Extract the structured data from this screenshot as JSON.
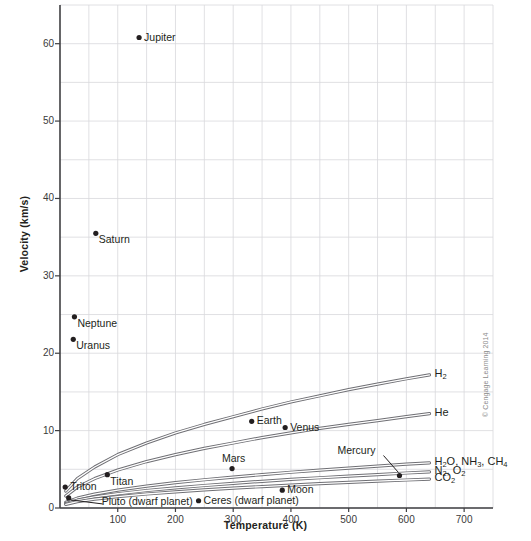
{
  "figure": {
    "credit": "© Cengage Learning 2014"
  },
  "chart_data": {
    "type": "line",
    "title": "",
    "xlabel": "Temperature (K)",
    "ylabel": "Velocity (km/s)",
    "xlim": [
      0,
      750
    ],
    "ylim": [
      0,
      65
    ],
    "grid": true,
    "x_major_ticks": [
      100,
      200,
      300,
      400,
      500,
      600,
      700
    ],
    "x_tick_labels": [
      "100",
      "200",
      "300",
      "400",
      "500",
      "600",
      "700"
    ],
    "x_minor_step": 50,
    "y_major_ticks": [
      0,
      10,
      20,
      30,
      40,
      50,
      60
    ],
    "y_tick_labels": [
      "0",
      "10",
      "20",
      "30",
      "40",
      "50",
      "60"
    ],
    "y_minor_step": 5,
    "legend_position": "inline-right-of-curve-ends",
    "series": [
      {
        "name": "H2",
        "label": "H<sub>2</sub>",
        "label_plain": "H2",
        "x": [
          10,
          30,
          60,
          100,
          150,
          200,
          250,
          300,
          350,
          400,
          450,
          500,
          550,
          600,
          640
        ],
        "y": [
          2.2,
          3.8,
          5.3,
          6.9,
          8.4,
          9.7,
          10.8,
          11.8,
          12.8,
          13.7,
          14.5,
          15.3,
          16.0,
          16.7,
          17.2
        ]
      },
      {
        "name": "He",
        "label": "He",
        "label_plain": "He",
        "x": [
          10,
          30,
          60,
          100,
          150,
          200,
          250,
          300,
          350,
          400,
          450,
          500,
          550,
          600,
          640
        ],
        "y": [
          1.55,
          2.7,
          3.8,
          4.9,
          6.0,
          6.9,
          7.7,
          8.4,
          9.1,
          9.7,
          10.3,
          10.8,
          11.3,
          11.8,
          12.2
        ]
      },
      {
        "name": "H2O, NH3, CH4",
        "label": "H<sub>2</sub>O, NH<sub>3</sub>, CH<sub>4</sub>",
        "label_plain": "H2O, NH3, CH4",
        "x": [
          10,
          30,
          60,
          100,
          150,
          200,
          250,
          300,
          350,
          400,
          450,
          500,
          550,
          600,
          640
        ],
        "y": [
          0.73,
          1.27,
          1.79,
          2.31,
          2.83,
          3.27,
          3.65,
          4.0,
          4.32,
          4.62,
          4.9,
          5.16,
          5.42,
          5.66,
          5.84
        ]
      },
      {
        "name": "N2, O2",
        "label": "N<sub>2</sub>, O<sub>2</sub>",
        "label_plain": "N2, O2",
        "x": [
          10,
          30,
          60,
          100,
          150,
          200,
          250,
          300,
          350,
          400,
          450,
          500,
          550,
          600,
          640
        ],
        "y": [
          0.58,
          1.01,
          1.43,
          1.84,
          2.26,
          2.61,
          2.91,
          3.19,
          3.45,
          3.69,
          3.91,
          4.12,
          4.32,
          4.52,
          4.66
        ]
      },
      {
        "name": "CO2",
        "label": "CO<sub>2</sub>",
        "label_plain": "CO2",
        "x": [
          10,
          30,
          60,
          100,
          150,
          200,
          250,
          300,
          350,
          400,
          450,
          500,
          550,
          600,
          640
        ],
        "y": [
          0.47,
          0.81,
          1.14,
          1.48,
          1.81,
          2.09,
          2.34,
          2.56,
          2.77,
          2.96,
          3.14,
          3.31,
          3.47,
          3.62,
          3.74
        ]
      }
    ],
    "points": [
      {
        "name": "Jupiter",
        "x": 137,
        "y": 60.8,
        "label": "Jupiter",
        "label_pos": "right"
      },
      {
        "name": "Saturn",
        "x": 62,
        "y": 35.5,
        "label": "Saturn",
        "label_pos": "below-right"
      },
      {
        "name": "Neptune",
        "x": 25,
        "y": 24.7,
        "label": "Neptune",
        "label_pos": "below-right"
      },
      {
        "name": "Uranus",
        "x": 23,
        "y": 21.8,
        "label": "Uranus",
        "label_pos": "below-right"
      },
      {
        "name": "Earth",
        "x": 332,
        "y": 11.2,
        "label": "Earth",
        "label_pos": "right"
      },
      {
        "name": "Venus",
        "x": 390,
        "y": 10.4,
        "label": "Venus",
        "label_pos": "right"
      },
      {
        "name": "Mars",
        "x": 298,
        "y": 5.1,
        "label": "Mars",
        "label_pos": "above"
      },
      {
        "name": "Mercury",
        "x": 588,
        "y": 4.2,
        "label": "Mercury",
        "label_pos": "leader-upper-left"
      },
      {
        "name": "Titan",
        "x": 82,
        "y": 4.3,
        "label": "Titan",
        "label_pos": "below-right"
      },
      {
        "name": "Triton",
        "x": 9,
        "y": 2.7,
        "label": "Triton",
        "label_pos": "right"
      },
      {
        "name": "Moon",
        "x": 385,
        "y": 2.3,
        "label": "Moon",
        "label_pos": "right"
      },
      {
        "name": "Ceres (dwarf planet)",
        "x": 240,
        "y": 0.94,
        "label": "Ceres (dwarf planet)",
        "label_pos": "right"
      },
      {
        "name": "Pluto (dwarf planet)",
        "x": 15,
        "y": 1.3,
        "label": "Pluto (dwarf planet)",
        "label_pos": "leader-right"
      }
    ]
  }
}
